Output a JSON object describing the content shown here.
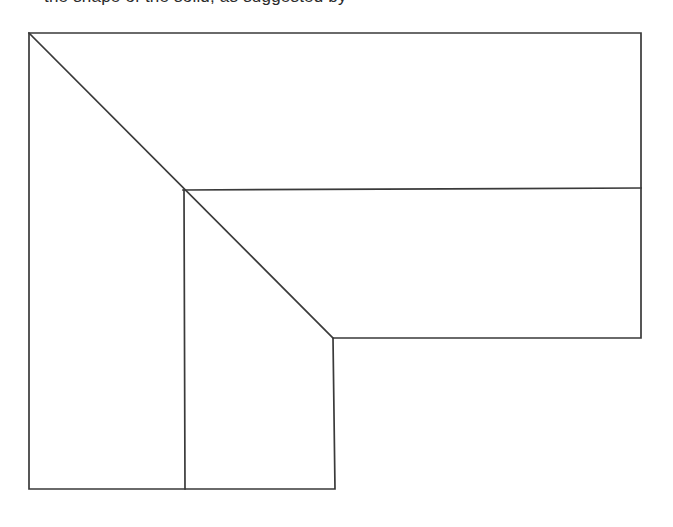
{
  "page": {
    "background_color": "#ffffff",
    "width": 673,
    "height": 527
  },
  "caption": {
    "text": "the shape of the solid, as suggested by",
    "note": "partially clipped at top edge of image",
    "color": "#2b2b2b"
  },
  "figure": {
    "name": "l-shaped-chamfered-polygon",
    "type": "line-drawing",
    "line_color": "#3a3a3a",
    "line_width": 1.7,
    "fill": "none",
    "outline_label": "outer-outline",
    "interior_labels": {
      "diagonal": "chamfer-diagonal",
      "horizontal_divider": "horizontal-divider",
      "vertical_divider": "vertical-divider"
    },
    "vertices": {
      "top_left": [
        29,
        33
      ],
      "top_right": [
        641,
        33
      ],
      "right_mid": [
        641,
        188
      ],
      "right_lower": [
        641,
        338
      ],
      "notch_corner": [
        333,
        338
      ],
      "notch_bottom": [
        335,
        489
      ],
      "bottom_left": [
        29,
        489
      ]
    },
    "segments": [
      {
        "name": "top-edge",
        "from": [
          29,
          33
        ],
        "to": [
          641,
          33
        ]
      },
      {
        "name": "right-edge-upper",
        "from": [
          641,
          33
        ],
        "to": [
          641,
          188
        ]
      },
      {
        "name": "right-edge-lower",
        "from": [
          641,
          188
        ],
        "to": [
          641,
          338
        ]
      },
      {
        "name": "bottom-edge-right-wing",
        "from": [
          641,
          338
        ],
        "to": [
          333,
          338
        ]
      },
      {
        "name": "inner-vertical-right",
        "from": [
          333,
          338
        ],
        "to": [
          335,
          489
        ]
      },
      {
        "name": "bottom-edge-left-wing",
        "from": [
          335,
          489
        ],
        "to": [
          29,
          489
        ]
      },
      {
        "name": "left-edge",
        "from": [
          29,
          489
        ],
        "to": [
          29,
          33
        ]
      },
      {
        "name": "chamfer-diagonal",
        "from": [
          29,
          33
        ],
        "to": [
          333,
          338
        ]
      },
      {
        "name": "horizontal-divider",
        "from": [
          183,
          190
        ],
        "to": [
          641,
          188
        ]
      },
      {
        "name": "vertical-divider",
        "from": [
          184,
          190
        ],
        "to": [
          185,
          489
        ]
      }
    ]
  }
}
